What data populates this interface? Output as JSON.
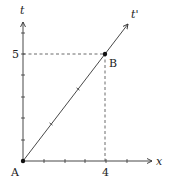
{
  "diagram": {
    "type": "spacetime-diagram",
    "axes": {
      "horizontal": {
        "label": "x",
        "tick_label": "4"
      },
      "vertical": {
        "label": "t",
        "tick_label": "5"
      }
    },
    "worldline": {
      "label": "t'"
    },
    "points": [
      {
        "label": "A",
        "coords": [
          0,
          0
        ]
      },
      {
        "label": "B",
        "coords": [
          4,
          5
        ]
      }
    ],
    "colors": {
      "line": "#333333",
      "dash": "#444444",
      "point": "#111111"
    }
  }
}
